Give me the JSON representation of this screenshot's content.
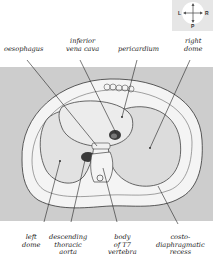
{
  "compass": {
    "left": "L",
    "right": "R",
    "posterior": "P",
    "anterior": "A"
  },
  "labels_top": [
    {
      "id": "oesophagus",
      "lines": [
        "oesophagus"
      ]
    },
    {
      "id": "inferior-vena-cava",
      "lines": [
        "inferior",
        "vena cava"
      ]
    },
    {
      "id": "pericardium",
      "lines": [
        "pericardium"
      ]
    },
    {
      "id": "right-dome",
      "lines": [
        "right",
        "dome"
      ]
    }
  ],
  "labels_bottom": [
    {
      "id": "left-dome",
      "lines": [
        "left",
        "dome"
      ]
    },
    {
      "id": "descending-thoracic-aorta",
      "lines": [
        "descending",
        "thoracic",
        "aorta"
      ]
    },
    {
      "id": "body-of-t7-vertebra",
      "lines": [
        "body",
        "of T7",
        "vertebra"
      ]
    },
    {
      "id": "costo-diaphragmatic-recess",
      "lines": [
        "costo-",
        "diaphragmatic",
        "recess"
      ]
    }
  ],
  "colors": {
    "panel": "#cdcdcd",
    "body": "#f4f4f4",
    "organ": "#e2e2e2",
    "vessel": "#3a3a3a",
    "line": "#222222"
  }
}
